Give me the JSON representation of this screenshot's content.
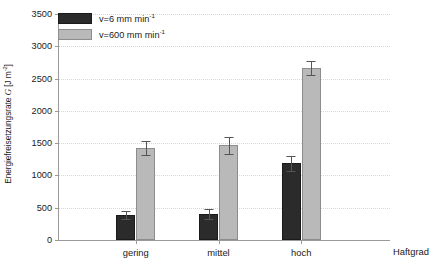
{
  "chart_data": {
    "type": "bar",
    "title": "",
    "subtitle": "",
    "xlabel": "Haftgrad",
    "ylabel": "Energiefreisetzungsrate 𝒢 [J m⁻²]",
    "ylabel_prefix": "Energiefreisetzungsrate ",
    "ylabel_symbol": "G",
    "ylabel_units": " [J m",
    "ylabel_units_exp": "-2",
    "ylabel_units_close": "]",
    "categories": [
      "gering",
      "mittel",
      "hoch"
    ],
    "ylim": [
      0,
      3500
    ],
    "yticks": [
      0,
      500,
      1000,
      1500,
      2000,
      2500,
      3000,
      3500
    ],
    "ytick_labels": [
      "0",
      "500",
      "1000",
      "1500",
      "2000",
      "2500",
      "3000",
      "3500"
    ],
    "grid": true,
    "grid_axis": "y",
    "legend_position": "upper-left",
    "series": [
      {
        "name": "v=6 mm min-1",
        "label_prefix": "v=6 mm min",
        "label_exp": "-1",
        "color": "#2b2b2b",
        "values": [
          385,
          400,
          1190
        ],
        "errors": [
          65,
          75,
          115
        ]
      },
      {
        "name": "v=600 mm min-1",
        "label_prefix": "v=600 mm min",
        "label_exp": "-1",
        "color": "#b9b9b9",
        "values": [
          1425,
          1465,
          2665
        ],
        "errors": [
          105,
          130,
          105
        ]
      }
    ]
  },
  "colors": {
    "dark_series": "#2b2b2b",
    "light_series": "#b9b9b9",
    "axis": "#9a9a9a",
    "grid": "#d8d8d8",
    "text": "#1a1a1a",
    "background": "#ffffff"
  }
}
